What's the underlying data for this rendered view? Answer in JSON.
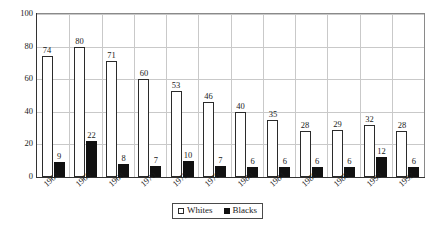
{
  "chart_data": {
    "type": "bar",
    "title": "",
    "subtitle": "",
    "xlabel": "",
    "ylabel": "",
    "categories": [
      "1964",
      "1966",
      "1968",
      "1970",
      "1972",
      "1976",
      "1980",
      "1984",
      "1986",
      "1988",
      "1990",
      "1992"
    ],
    "series": [
      {
        "name": "Whites",
        "color": "#ffffff",
        "edge": "#2b2b2b",
        "values": [
          74,
          80,
          71,
          60,
          53,
          46,
          40,
          35,
          28,
          29,
          32,
          28
        ]
      },
      {
        "name": "Blacks",
        "color": "#111111",
        "edge": "#111111",
        "values": [
          9,
          22,
          8,
          7,
          10,
          7,
          6,
          6,
          6,
          6,
          12,
          6
        ]
      }
    ],
    "ylim": [
      0,
      100
    ],
    "yticks": [
      0,
      20,
      40,
      60,
      80,
      100
    ],
    "ytick_labels": [
      "0",
      "20",
      "40",
      "60",
      "80",
      "100"
    ],
    "grid": true,
    "grid_axis": "y",
    "legend_position": "bottom-center",
    "data_labels": true,
    "xtick_rotation": -42
  },
  "legend": {
    "items": [
      {
        "label": "Whites",
        "swatch": "open-square-icon"
      },
      {
        "label": "Blacks",
        "swatch": "filled-square-icon"
      }
    ]
  },
  "caption": {
    "cutoff_text": " "
  }
}
